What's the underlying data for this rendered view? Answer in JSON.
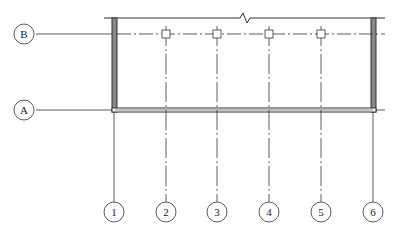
{
  "drawing": {
    "type": "structural grid plan",
    "row_grids": [
      {
        "label": "B",
        "y": 34
      },
      {
        "label": "A",
        "y": 110
      }
    ],
    "column_grids": [
      {
        "label": "1",
        "x": 114
      },
      {
        "label": "2",
        "x": 166
      },
      {
        "label": "3",
        "x": 217
      },
      {
        "label": "4",
        "x": 269
      },
      {
        "label": "5",
        "x": 321
      },
      {
        "label": "6",
        "x": 373
      }
    ],
    "columns_at_grid_B": [
      "2",
      "3",
      "4",
      "5"
    ],
    "break_line_symbol": "zigzag",
    "colors": {
      "line": "#333333",
      "wall_fill": "#888888",
      "background": "#ffffff"
    }
  }
}
